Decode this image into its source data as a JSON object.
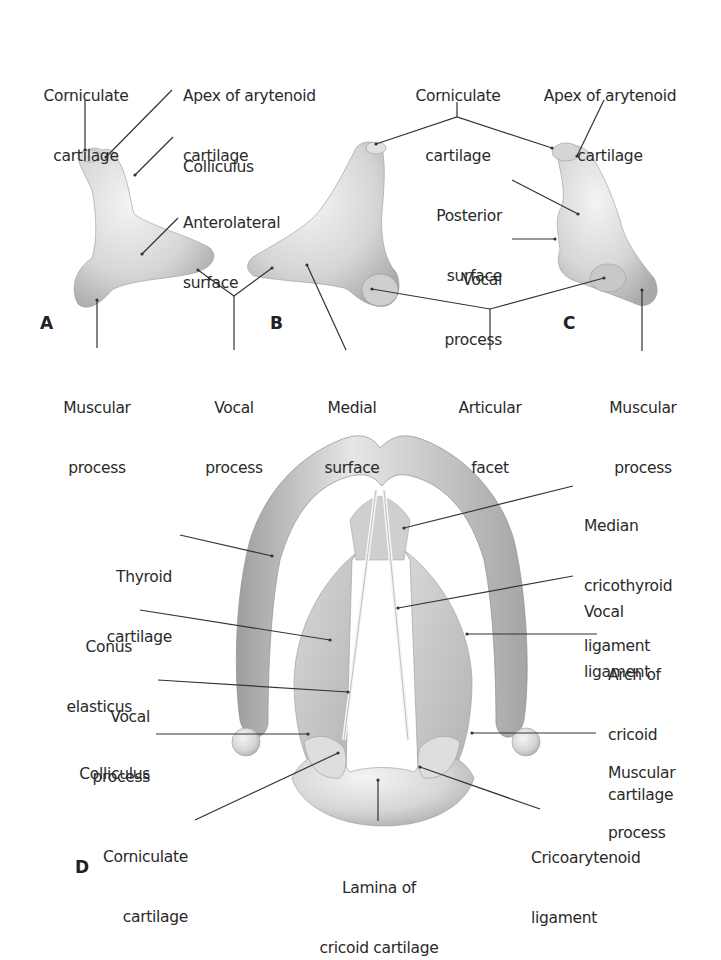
{
  "figure": {
    "background": "#ffffff",
    "cartilage_color": "#d9d9d9",
    "line_color": "#333333"
  },
  "panels": {
    "A": {
      "letter": "A",
      "labels": {
        "corniculate": [
          "Corniculate",
          "cartilage"
        ],
        "apex": [
          "Apex of arytenoid",
          "cartilage"
        ],
        "colliculus": [
          "Colliculus"
        ],
        "anterolateral": [
          "Anterolateral",
          "surface"
        ],
        "muscular": [
          "Muscular",
          "process"
        ]
      }
    },
    "AB_shared": {
      "vocal": [
        "Vocal",
        "process"
      ]
    },
    "B": {
      "letter": "B",
      "labels": {
        "medial": [
          "Medial",
          "surface"
        ]
      }
    },
    "BC_shared": {
      "corniculate": [
        "Corniculate",
        "cartilage"
      ],
      "articular": [
        "Articular",
        "facet"
      ]
    },
    "C": {
      "letter": "C",
      "labels": {
        "apex": [
          "Apex of arytenoid",
          "cartilage"
        ],
        "posterior": [
          "Posterior",
          "surface"
        ],
        "vocal": [
          "Vocal",
          "process"
        ],
        "muscular": [
          "Muscular",
          "process"
        ]
      }
    },
    "D": {
      "letter": "D",
      "labels": {
        "thyroid": [
          "Thyroid",
          "cartilage"
        ],
        "conus": [
          "Conus",
          "elasticus"
        ],
        "vocal_process": [
          "Vocal",
          "process"
        ],
        "colliculus": [
          "Colliculus"
        ],
        "corniculate": [
          "Corniculate",
          "cartilage"
        ],
        "lamina": [
          "Lamina of",
          "cricoid cartilage"
        ],
        "cricoarytenoid": [
          "Cricoarytenoid",
          "ligament"
        ],
        "muscular": [
          "Muscular",
          "process"
        ],
        "arch": [
          "Arch of",
          "cricoid",
          "cartilage"
        ],
        "vocal_ligament": [
          "Vocal",
          "ligament"
        ],
        "median": [
          "Median",
          "cricothyroid",
          "ligament"
        ]
      }
    }
  }
}
